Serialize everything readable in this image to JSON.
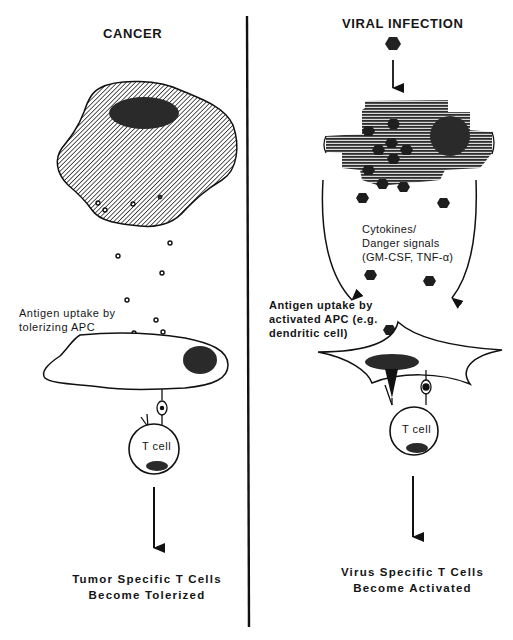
{
  "figure": {
    "type": "comparative immunology schematic",
    "divider": "vertical line separating two panels"
  },
  "left_panel": {
    "title": "CANCER",
    "tumor_cell": {
      "fill": "diagonal hatching",
      "nucleus": "dark ellipse"
    },
    "antigen_particles": "small open circles released from tumor cell",
    "apc_label_line1": "Antigen uptake by",
    "apc_label_line2": "tolerizing APC",
    "t_cell_label": "T cell",
    "outcome_line1": "Tumor Specific T Cells",
    "outcome_line2": "Become Tolerized"
  },
  "right_panel": {
    "title": "VIRAL INFECTION",
    "virus_particles": "dark hexagons",
    "infected_cell": {
      "fill": "horizontal stripes",
      "nucleus": "dark circle"
    },
    "signal_label_line1": "Cytokines/",
    "signal_label_line2": "Danger signals",
    "signal_label_line3": "(GM-CSF, TNF-α)",
    "apc_label_line1": "Antigen uptake by",
    "apc_label_line2": "activated APC (e.g.",
    "apc_label_line3": "dendritic   cell)",
    "t_cell_label": "T cell",
    "outcome_line1": "Virus Specific T Cells",
    "outcome_line2": "Become Activated"
  },
  "colors": {
    "ink": "#111111",
    "nucleus": "#2a2a2a",
    "background": "#ffffff"
  }
}
